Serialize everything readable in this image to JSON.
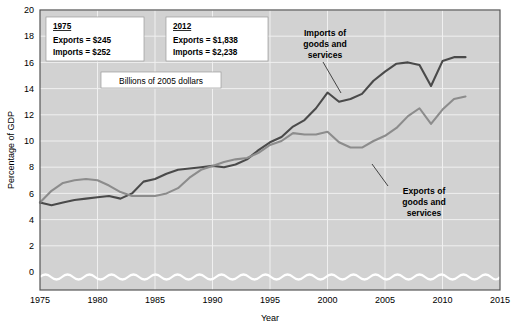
{
  "chart_data": {
    "type": "line",
    "title": "",
    "xlabel": "Year",
    "ylabel": "Percentage of GDP",
    "xlim": [
      1975,
      2015
    ],
    "ylim": [
      0,
      20
    ],
    "xticks": [
      1975,
      1980,
      1985,
      1990,
      1995,
      2000,
      2005,
      2010,
      2015
    ],
    "yticks": [
      0,
      2,
      4,
      6,
      8,
      10,
      12,
      14,
      16,
      18,
      20
    ],
    "grid": true,
    "legend_position": "inline-callouts",
    "axis_break": true,
    "series": [
      {
        "name": "Imports of goods and services",
        "color": "#4a4a4a",
        "x": [
          1975,
          1976,
          1977,
          1978,
          1979,
          1980,
          1981,
          1982,
          1983,
          1984,
          1985,
          1986,
          1987,
          1988,
          1989,
          1990,
          1991,
          1992,
          1993,
          1994,
          1995,
          1996,
          1997,
          1998,
          1999,
          2000,
          2001,
          2002,
          2003,
          2004,
          2005,
          2006,
          2007,
          2008,
          2009,
          2010,
          2011,
          2012
        ],
        "values": [
          5.3,
          5.1,
          5.3,
          5.5,
          5.6,
          5.7,
          5.8,
          5.6,
          6.0,
          6.9,
          7.1,
          7.5,
          7.8,
          7.9,
          8.0,
          8.1,
          8.0,
          8.2,
          8.6,
          9.3,
          9.9,
          10.3,
          11.1,
          11.6,
          12.5,
          13.7,
          13.0,
          13.2,
          13.6,
          14.6,
          15.3,
          15.9,
          16.0,
          15.8,
          14.2,
          16.1,
          16.4,
          16.4
        ]
      },
      {
        "name": "Exports of goods and services",
        "color": "#8c8c8c",
        "x": [
          1975,
          1976,
          1977,
          1978,
          1979,
          1980,
          1981,
          1982,
          1983,
          1984,
          1985,
          1986,
          1987,
          1988,
          1989,
          1990,
          1991,
          1992,
          1993,
          1994,
          1995,
          1996,
          1997,
          1998,
          1999,
          2000,
          2001,
          2002,
          2003,
          2004,
          2005,
          2006,
          2007,
          2008,
          2009,
          2010,
          2011,
          2012
        ],
        "values": [
          5.3,
          6.2,
          6.8,
          7.0,
          7.1,
          7.0,
          6.6,
          6.1,
          5.8,
          5.8,
          5.8,
          6.0,
          6.4,
          7.2,
          7.8,
          8.1,
          8.4,
          8.6,
          8.7,
          9.1,
          9.7,
          10.0,
          10.6,
          10.5,
          10.5,
          10.7,
          9.9,
          9.5,
          9.5,
          10.0,
          10.4,
          11.0,
          11.9,
          12.5,
          11.3,
          12.4,
          13.2,
          13.4
        ]
      }
    ],
    "annotations": [
      {
        "id": "note-1975",
        "heading": "1975",
        "lines": [
          "Exports  =  $245",
          "Imports  =  $252"
        ]
      },
      {
        "id": "note-2012",
        "heading": "2012",
        "lines": [
          "Exports  =  $1,838",
          "Imports  =  $2,238"
        ]
      },
      {
        "id": "note-units",
        "heading": "",
        "lines": [
          "Billions of 2005 dollars"
        ]
      }
    ],
    "callouts": [
      {
        "id": "callout-imports",
        "lines": [
          "Imports of",
          "goods and",
          "services"
        ],
        "target_year": 2000,
        "target_value": 13.0
      },
      {
        "id": "callout-exports",
        "lines": [
          "Exports of",
          "goods and",
          "services"
        ],
        "target_year": 2003,
        "target_value": 9.5
      }
    ]
  },
  "labels": {
    "units_box": "Billions of 2005 dollars",
    "note1_head": "1975",
    "note1_l1": "Exports  =  $245",
    "note1_l2": "Imports  =  $252",
    "note2_head": "2012",
    "note2_l1": "Exports  =  $1,838",
    "note2_l2": "Imports  =  $2,238",
    "callout_imports_l1": "Imports of",
    "callout_imports_l2": "goods and",
    "callout_imports_l3": "services",
    "callout_exports_l1": "Exports of",
    "callout_exports_l2": "goods and",
    "callout_exports_l3": "services",
    "ylabel": "Percentage of GDP",
    "xlabel": "Year"
  },
  "ticks": {
    "y": [
      "0",
      "2",
      "4",
      "6",
      "8",
      "10",
      "12",
      "14",
      "16",
      "18",
      "20"
    ],
    "x": [
      "1975",
      "1980",
      "1985",
      "1990",
      "1995",
      "2000",
      "2005",
      "2010",
      "2015"
    ]
  },
  "colors": {
    "plot_background": "#d2d2d2",
    "page_background": "#ffffff",
    "gridline": "#f0f0f0",
    "imports_line": "#4a4a4a",
    "exports_line": "#8c8c8c",
    "axis": "#555555",
    "note_box_fill": "#ffffff"
  }
}
